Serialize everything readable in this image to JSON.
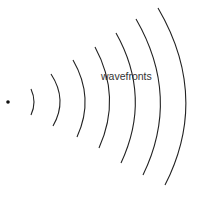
{
  "diagram": {
    "label": "wavefronts",
    "source_point": {
      "x": 8,
      "y": 102
    },
    "stroke_color": "#222222",
    "wavefronts": [
      {
        "d": "M31,89 Q37,102 31,115"
      },
      {
        "d": "M51,74 Q68,100 53,126"
      },
      {
        "d": "M73,60 Q95,98 77,137"
      },
      {
        "d": "M95,47 Q122,97 99,148"
      },
      {
        "d": "M116,33 Q152,97 121,163"
      },
      {
        "d": "M136,19 Q181,97 143,175"
      },
      {
        "d": "M158,8 Q210,97 165,185"
      }
    ]
  }
}
